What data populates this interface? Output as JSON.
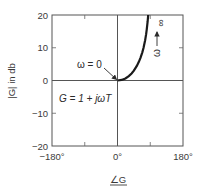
{
  "chart_data": {
    "type": "line",
    "title": "",
    "xlabel": "∠G",
    "ylabel": "|G| in db",
    "xlim": [
      -180,
      180
    ],
    "ylim": [
      -20,
      20
    ],
    "x_ticks": [
      -180,
      -90,
      0,
      90,
      180
    ],
    "x_tick_labels": [
      {
        "value": -180,
        "label": "−180°"
      },
      {
        "value": 0,
        "label": "0°"
      },
      {
        "value": 180,
        "label": "180°"
      }
    ],
    "y_ticks": [
      -20,
      -10,
      0,
      10,
      20
    ],
    "y_tick_labels": [
      {
        "value": 20,
        "label": "20"
      },
      {
        "value": 10,
        "label": "10"
      },
      {
        "value": 0,
        "label": "0"
      },
      {
        "value": -10,
        "label": "−10"
      },
      {
        "value": -20,
        "label": "−20"
      }
    ],
    "grid": false,
    "series": [
      {
        "name": "G = 1 + jωT",
        "description": "Nichols plot: phase (deg) vs magnitude (dB), ωT from 0 to ∞",
        "points": [
          {
            "x": 0,
            "y": 0
          },
          {
            "x": 11.3,
            "y": 0.17
          },
          {
            "x": 21.8,
            "y": 0.64
          },
          {
            "x": 31.0,
            "y": 1.34
          },
          {
            "x": 38.7,
            "y": 2.15
          },
          {
            "x": 45.0,
            "y": 3.01
          },
          {
            "x": 53.1,
            "y": 4.44
          },
          {
            "x": 59.0,
            "y": 5.77
          },
          {
            "x": 63.4,
            "y": 6.99
          },
          {
            "x": 68.2,
            "y": 8.6
          },
          {
            "x": 71.6,
            "y": 10.0
          },
          {
            "x": 75.96,
            "y": 12.3
          },
          {
            "x": 78.7,
            "y": 14.15
          },
          {
            "x": 80.5,
            "y": 15.7
          },
          {
            "x": 82.9,
            "y": 18.1
          },
          {
            "x": 84.3,
            "y": 20.0
          }
        ]
      }
    ],
    "annotations": {
      "omega_zero": "ω = 0",
      "omega_label": "ω",
      "infinity": "∞",
      "equation": "G = 1 + jωT"
    }
  }
}
